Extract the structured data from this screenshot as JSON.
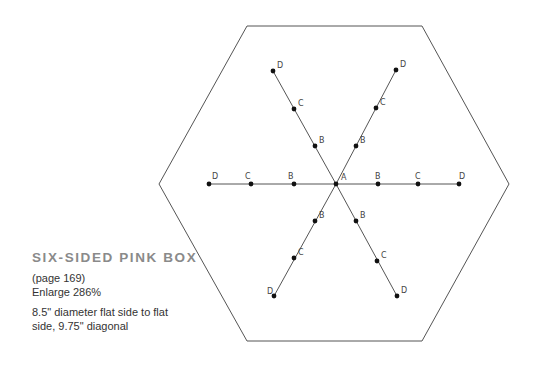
{
  "caption": {
    "title": "SIX-SIDED PINK BOX",
    "page_ref": "(page 169)",
    "enlarge": "Enlarge 286%",
    "dimensions_line1": "8.5\" diameter flat side to flat",
    "dimensions_line2": "side, 9.75\" diagonal"
  },
  "diagram": {
    "shape": "hexagon",
    "stroke_color": "#555555",
    "point_color": "#111111",
    "hexagon_vertices": [
      [
        247,
        26
      ],
      [
        422,
        26
      ],
      [
        509,
        184
      ],
      [
        422,
        341
      ],
      [
        247,
        341
      ],
      [
        159,
        184
      ]
    ],
    "center": {
      "label": "A",
      "x": 336,
      "y": 184
    },
    "arms": [
      {
        "name": "left",
        "points": [
          {
            "label": "B",
            "x": 294,
            "y": 184
          },
          {
            "label": "C",
            "x": 251,
            "y": 184
          },
          {
            "label": "D",
            "x": 209,
            "y": 184
          }
        ]
      },
      {
        "name": "right",
        "points": [
          {
            "label": "B",
            "x": 378,
            "y": 184
          },
          {
            "label": "C",
            "x": 418,
            "y": 184
          },
          {
            "label": "D",
            "x": 459,
            "y": 184
          }
        ]
      },
      {
        "name": "upper-left",
        "points": [
          {
            "label": "B",
            "x": 315,
            "y": 146
          },
          {
            "label": "C",
            "x": 294,
            "y": 109
          },
          {
            "label": "D",
            "x": 273,
            "y": 71
          }
        ]
      },
      {
        "name": "upper-right",
        "points": [
          {
            "label": "B",
            "x": 356,
            "y": 146
          },
          {
            "label": "C",
            "x": 376,
            "y": 108
          },
          {
            "label": "D",
            "x": 396,
            "y": 70
          }
        ]
      },
      {
        "name": "lower-left",
        "points": [
          {
            "label": "B",
            "x": 315,
            "y": 221
          },
          {
            "label": "C",
            "x": 294,
            "y": 258
          },
          {
            "label": "D",
            "x": 274,
            "y": 296
          }
        ]
      },
      {
        "name": "lower-right",
        "points": [
          {
            "label": "B",
            "x": 356,
            "y": 221
          },
          {
            "label": "C",
            "x": 377,
            "y": 261
          },
          {
            "label": "D",
            "x": 397,
            "y": 296
          }
        ]
      }
    ],
    "labels": {
      "A": "A",
      "B": "B",
      "C": "C",
      "D": "D"
    }
  }
}
